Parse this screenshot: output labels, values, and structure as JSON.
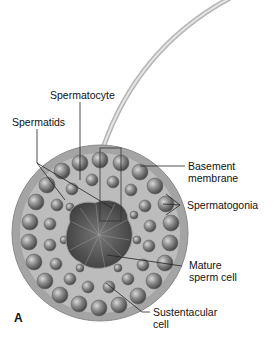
{
  "diagram": {
    "panel_label": "A",
    "labels": {
      "spermatocyte": "Spermatocyte",
      "spermatids": "Spermatids",
      "basement_membrane_1": "Basement",
      "basement_membrane_2": "membrane",
      "spermatogonia": "Spermatogonia",
      "mature_sperm_1": "Mature",
      "mature_sperm_2": "sperm cell",
      "sustentacular_1": "Sustentacular",
      "sustentacular_2": "cell"
    },
    "colors": {
      "tubule_wall": "#a8a8a8",
      "cell": "#7a7a7a",
      "lumen": "#4a4a4a",
      "line": "#222222"
    }
  }
}
